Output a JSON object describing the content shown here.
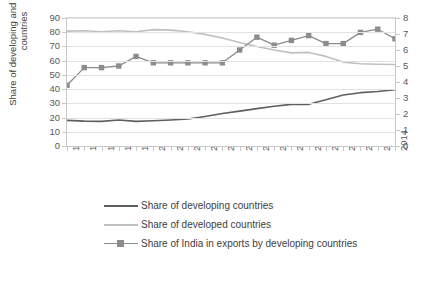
{
  "chart_data": {
    "type": "line",
    "title": "",
    "xlabel": "",
    "ylabel": "Share of developing and developed countries",
    "ylabel_right": "",
    "grid": true,
    "legend_position": "bottom",
    "x": [
      "1995",
      "1996",
      "1997",
      "1998",
      "1999",
      "2000",
      "2001",
      "2002",
      "2003",
      "2004",
      "2005",
      "2006",
      "2007",
      "2008",
      "2009",
      "2010",
      "2011",
      "2012",
      "2013",
      "2014"
    ],
    "categories": [
      "1995",
      "1996",
      "1997",
      "1998",
      "1999",
      "2000",
      "2001",
      "2002",
      "2003",
      "2004",
      "2005",
      "2006",
      "2007",
      "2008",
      "2009",
      "2010",
      "2011",
      "2012",
      "2013",
      "2014"
    ],
    "ylim": [
      0,
      90
    ],
    "yticks": [
      "0",
      "10",
      "20",
      "30",
      "40",
      "50",
      "60",
      "70",
      "80",
      "90"
    ],
    "ylim_right": [
      0,
      8
    ],
    "yticks_right": [
      "0",
      "1",
      "2",
      "3",
      "4",
      "5",
      "6",
      "7",
      "8"
    ],
    "series": [
      {
        "name": "Share of developing countries",
        "axis": "left",
        "color": "#5f5f5f",
        "marker": "none",
        "values": [
          18.0,
          17.5,
          17.3,
          18.3,
          17.3,
          17.8,
          18.3,
          19.0,
          20.8,
          22.8,
          24.5,
          26.3,
          28.0,
          29.3,
          29.3,
          32.5,
          35.8,
          37.5,
          38.3,
          39.5
        ]
      },
      {
        "name": "Share of developed countries",
        "axis": "left",
        "color": "#c0c0c0",
        "marker": "none",
        "values": [
          80.8,
          81.0,
          80.3,
          81.0,
          80.3,
          81.8,
          81.5,
          80.3,
          78.5,
          76.0,
          72.8,
          70.0,
          67.5,
          65.5,
          65.8,
          63.0,
          59.0,
          57.8,
          57.5,
          57.3
        ]
      },
      {
        "name": "Share of India in exports by developing countries",
        "axis": "right",
        "color": "#8c8c8c",
        "marker": "square",
        "values": [
          3.8,
          4.9,
          4.9,
          5.0,
          5.6,
          5.2,
          5.2,
          5.2,
          5.2,
          5.2,
          6.0,
          6.8,
          6.3,
          6.6,
          6.9,
          6.4,
          6.4,
          7.1,
          7.3,
          6.7
        ]
      }
    ]
  },
  "legend": {
    "items": [
      {
        "label": "Share of developing countries",
        "color": "#5f5f5f",
        "marker": false
      },
      {
        "label": "Share of developed countries",
        "color": "#c0c0c0",
        "marker": false
      },
      {
        "label": "Share of India in exports by developing countries",
        "color": "#8c8c8c",
        "marker": true
      }
    ]
  }
}
